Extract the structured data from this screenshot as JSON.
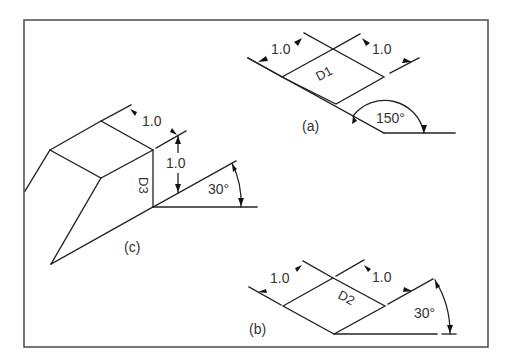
{
  "figure": {
    "panels": [
      {
        "id": "a",
        "caption": "(a)",
        "face_label": "D1",
        "dim_left": "1.0",
        "dim_right": "1.0",
        "angle": "150°"
      },
      {
        "id": "b",
        "caption": "(b)",
        "face_label": "D2",
        "dim_left": "1.0",
        "dim_right": "1.0",
        "angle": "30°"
      },
      {
        "id": "c",
        "caption": "(c)",
        "face_label": "D3",
        "dim_top": "1.0",
        "dim_vertical": "1.0",
        "angle": "30°"
      }
    ]
  },
  "colors": {
    "line": "#222222",
    "frame": "#555555",
    "background": "#ffffff"
  }
}
